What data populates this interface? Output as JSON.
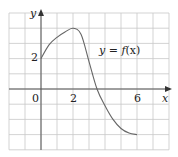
{
  "chart_data": {
    "type": "line",
    "title": "",
    "xlabel": "x",
    "ylabel": "y",
    "curve_label": "y = f(x)",
    "curve_label_parts": {
      "prefix": "y = ",
      "func": "f",
      "arg": "(x)"
    },
    "x_tick_labels": [
      "0",
      "2",
      "6"
    ],
    "y_tick_labels": [
      "2"
    ],
    "xlim": [
      -2,
      8
    ],
    "ylim": [
      -4,
      5
    ],
    "grid": true,
    "series": [
      {
        "name": "f(x)",
        "x": [
          0,
          0.5,
          1,
          1.5,
          2,
          2.5,
          3,
          3.5,
          4,
          4.5,
          5,
          5.5,
          6
        ],
        "values": [
          2,
          2.9,
          3.4,
          3.75,
          4,
          3.6,
          1.8,
          0,
          -1.1,
          -2.0,
          -2.6,
          -2.9,
          -3
        ]
      }
    ],
    "colors": {
      "grid": "#c8c8c8",
      "axis": "#555555",
      "curve": "#666666",
      "text": "#222222"
    }
  }
}
